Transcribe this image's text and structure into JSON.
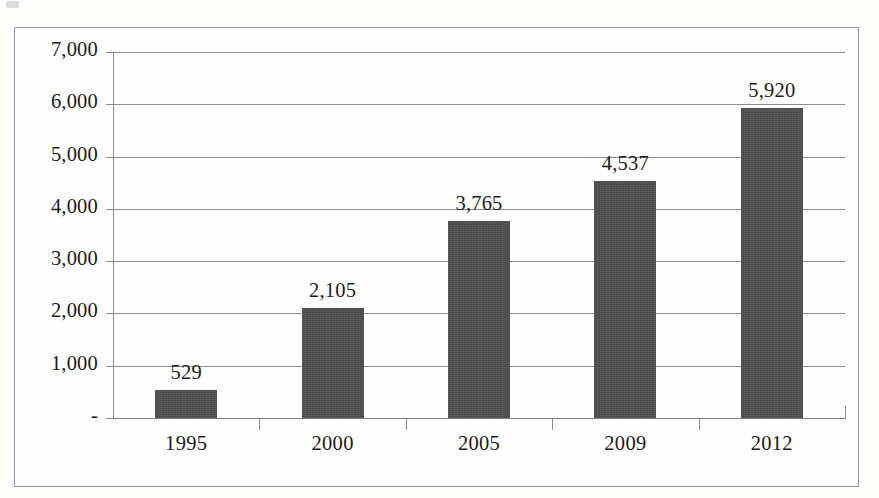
{
  "chart_data": {
    "type": "bar",
    "title": "",
    "subtitle": "",
    "xlabel": "",
    "ylabel": "",
    "categories": [
      "1995",
      "2000",
      "2005",
      "2009",
      "2012"
    ],
    "values": [
      529,
      2105,
      3765,
      4537,
      5920
    ],
    "value_labels": [
      "529",
      "2,105",
      "3,765",
      "4,537",
      "5,920"
    ],
    "ylim": [
      0,
      7000
    ],
    "ytick_values": [
      0,
      1000,
      2000,
      3000,
      4000,
      5000,
      6000,
      7000
    ],
    "ytick_labels": [
      "-",
      "1,000",
      "2,000",
      "3,000",
      "4,000",
      "5,000",
      "6,000",
      "7,000"
    ],
    "grid": true,
    "grid_axis": "y",
    "legend": false,
    "legend_position": "none",
    "bar_color": "#4a4a4a",
    "gridline_color": "#8d8d8d",
    "background_color": "#fefefe",
    "border_color": "#9a9a9a",
    "text_color": "#1b1b1b",
    "data_labels_shown": true,
    "series": [
      {
        "name": "",
        "values": [
          529,
          2105,
          3765,
          4537,
          5920
        ]
      }
    ]
  }
}
